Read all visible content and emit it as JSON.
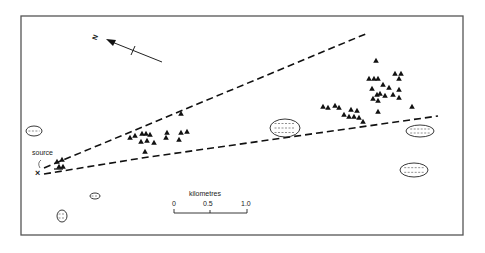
{
  "figure": {
    "frame": {
      "x": 21,
      "y": 16,
      "w": 442,
      "h": 219,
      "stroke": "#555555"
    },
    "ink_color": "#111111",
    "north_arrow": {
      "label": "N",
      "tail": [
        162,
        62
      ],
      "head": [
        107,
        40
      ],
      "label_pos": [
        96,
        36
      ]
    },
    "source": {
      "label": "source",
      "marker": "X",
      "pos": [
        39,
        173
      ],
      "label_pos": [
        32,
        154
      ]
    },
    "plume_lines": {
      "upper": {
        "from": [
          44,
          168
        ],
        "to": [
          368,
          33
        ]
      },
      "lower": {
        "from": [
          44,
          174
        ],
        "via": [
          142,
          158
        ],
        "to": [
          438,
          116
        ]
      }
    },
    "scale_bar": {
      "title": "kilometres",
      "ticks": [
        "0",
        "0.5",
        "1.0"
      ],
      "x0": 174,
      "x1": 247,
      "y": 213
    },
    "legend_symbols": {
      "mapped_site": "filled-triangle",
      "lake": "dashed-hatched-outline"
    }
  },
  "chart_data": {
    "type": "scatter",
    "title": "",
    "scale": {
      "unit": "kilometres",
      "ticks": [
        0,
        0.5,
        1.0
      ]
    },
    "source_point": {
      "label": "source",
      "x": 39,
      "y": 173
    },
    "triangle_sites": [
      [
        57,
        162
      ],
      [
        62,
        160
      ],
      [
        59,
        167
      ],
      [
        63,
        167
      ],
      [
        130,
        138
      ],
      [
        135,
        136
      ],
      [
        142,
        134
      ],
      [
        146,
        134
      ],
      [
        150,
        135
      ],
      [
        141,
        142
      ],
      [
        147,
        141
      ],
      [
        154,
        143
      ],
      [
        145,
        152
      ],
      [
        167,
        133
      ],
      [
        166,
        138
      ],
      [
        181,
        133
      ],
      [
        187,
        132
      ],
      [
        179,
        140
      ],
      [
        181,
        114
      ],
      [
        376,
        61
      ],
      [
        369,
        79
      ],
      [
        374,
        79
      ],
      [
        378,
        79
      ],
      [
        395,
        74
      ],
      [
        401,
        74
      ],
      [
        383,
        85
      ],
      [
        399,
        79
      ],
      [
        372,
        89
      ],
      [
        389,
        88
      ],
      [
        380,
        94
      ],
      [
        373,
        99
      ],
      [
        377,
        95
      ],
      [
        385,
        96
      ],
      [
        393,
        95
      ],
      [
        399,
        90
      ],
      [
        378,
        101
      ],
      [
        399,
        98
      ],
      [
        412,
        107
      ],
      [
        378,
        112
      ],
      [
        323,
        107
      ],
      [
        328,
        108
      ],
      [
        335,
        106
      ],
      [
        339,
        108
      ],
      [
        344,
        115
      ],
      [
        351,
        110
      ],
      [
        357,
        111
      ],
      [
        349,
        117
      ],
      [
        354,
        117
      ],
      [
        359,
        118
      ],
      [
        363,
        122
      ]
    ],
    "lakes": [
      {
        "cx": 34,
        "cy": 131,
        "rx": 8,
        "ry": 5
      },
      {
        "cx": 95,
        "cy": 196,
        "rx": 5,
        "ry": 3
      },
      {
        "cx": 62,
        "cy": 216,
        "rx": 5,
        "ry": 6
      },
      {
        "cx": 285,
        "cy": 128,
        "rx": 15,
        "ry": 9
      },
      {
        "cx": 420,
        "cy": 131,
        "rx": 14,
        "ry": 6
      },
      {
        "cx": 414,
        "cy": 170,
        "rx": 14,
        "ry": 7
      }
    ]
  }
}
